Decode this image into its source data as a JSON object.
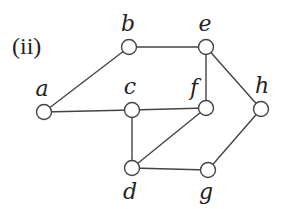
{
  "title": "(ii)",
  "graph": {
    "nodes": [
      {
        "id": "a",
        "label": "a",
        "x": 44,
        "y": 112,
        "lx": 42,
        "ly": 96
      },
      {
        "id": "b",
        "label": "b",
        "x": 129,
        "y": 47,
        "lx": 128,
        "ly": 31
      },
      {
        "id": "c",
        "label": "c",
        "x": 132,
        "y": 110,
        "lx": 130,
        "ly": 94
      },
      {
        "id": "e",
        "label": "e",
        "x": 206,
        "y": 47,
        "lx": 205,
        "ly": 31
      },
      {
        "id": "f",
        "label": "f",
        "x": 206,
        "y": 108,
        "lx": 194,
        "ly": 95
      },
      {
        "id": "h",
        "label": "h",
        "x": 261,
        "y": 109,
        "lx": 262,
        "ly": 93
      },
      {
        "id": "d",
        "label": "d",
        "x": 132,
        "y": 168,
        "lx": 130,
        "ly": 199
      },
      {
        "id": "g",
        "label": "g",
        "x": 208,
        "y": 170,
        "lx": 206,
        "ly": 199
      }
    ],
    "edges": [
      [
        "a",
        "b"
      ],
      [
        "a",
        "c"
      ],
      [
        "b",
        "e"
      ],
      [
        "c",
        "f"
      ],
      [
        "c",
        "d"
      ],
      [
        "e",
        "f"
      ],
      [
        "e",
        "h"
      ],
      [
        "f",
        "d"
      ],
      [
        "d",
        "g"
      ],
      [
        "g",
        "h"
      ]
    ]
  }
}
